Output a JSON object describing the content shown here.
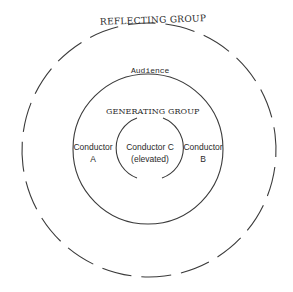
{
  "diagram": {
    "type": "concentric-groups",
    "stroke_color": "#3a3a3a",
    "labels": {
      "outer": "REFLECTING GROUP",
      "middle": "Audience",
      "inner": "GENERATING GROUP"
    },
    "conductors": {
      "a": {
        "line1": "Conductor",
        "line2": "A"
      },
      "b": {
        "line1": "Conductor",
        "line2": "B"
      },
      "c": {
        "line1": "Conductor C",
        "line2": "(elevated)"
      }
    },
    "circles": [
      {
        "name": "reflecting-group-ring",
        "style": "dashed",
        "cx": 149,
        "cy": 150,
        "r": 127
      },
      {
        "name": "audience-ring",
        "style": "solid",
        "cx": 148,
        "cy": 149,
        "r": 75
      },
      {
        "name": "generating-group-arcs",
        "style": "split-arcs",
        "cx": 150,
        "cy": 148,
        "r": 32
      }
    ]
  }
}
